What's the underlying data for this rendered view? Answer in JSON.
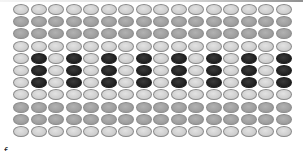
{
  "figure": {
    "rows": 11,
    "columns": 16,
    "colors": {
      "light": "#cfcfcf",
      "medium": "#9f9f9f",
      "dark": "#232323",
      "border": "#8a8a8a"
    },
    "row_pattern": [
      "light",
      "medium",
      "medium",
      "light",
      "alt-dark",
      "alt-dark",
      "alt-dark",
      "light",
      "medium",
      "medium",
      "light"
    ],
    "alt_dark_rule": "dark beads at even column positions (2nd, 4th, ..., 16th); light otherwise",
    "caption_visible_fragment": "ƒ    .    .    ."
  }
}
